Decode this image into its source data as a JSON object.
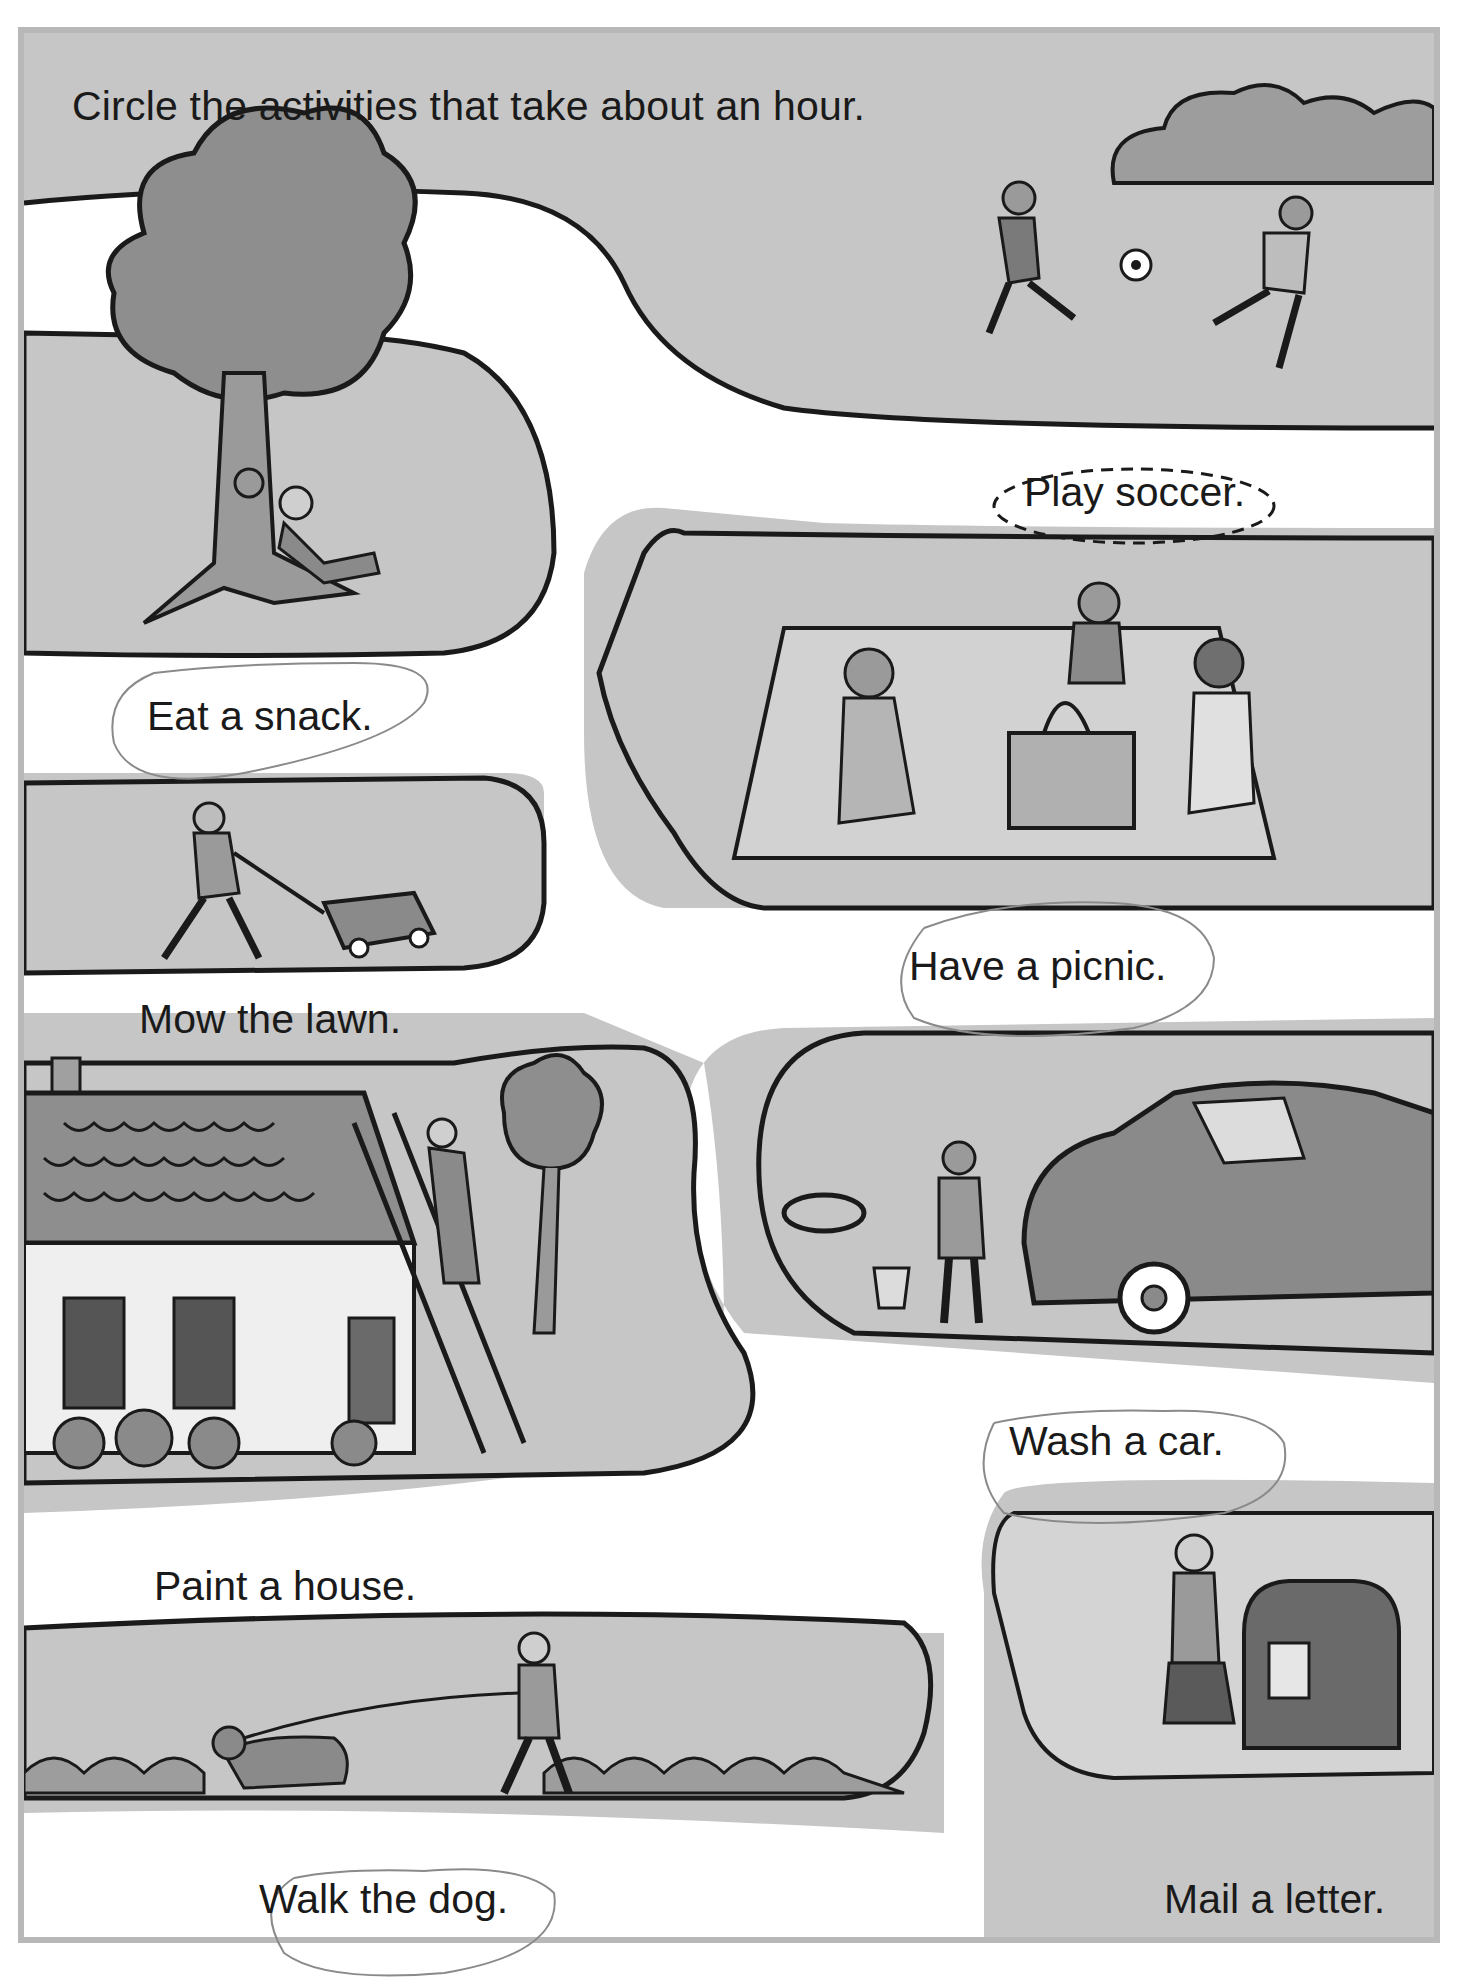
{
  "worksheet": {
    "instruction": "Circle the activities that take about an hour.",
    "example": {
      "label": "Play soccer.",
      "marking": "dashed-ellipse"
    },
    "activities": [
      {
        "id": "eat-snack",
        "label": "Eat a snack.",
        "circled_in_pencil": true
      },
      {
        "id": "play-soccer",
        "label": "Play soccer.",
        "circled_in_pencil": false,
        "example": true
      },
      {
        "id": "mow-lawn",
        "label": "Mow the lawn.",
        "circled_in_pencil": false
      },
      {
        "id": "have-picnic",
        "label": "Have a picnic.",
        "circled_in_pencil": true
      },
      {
        "id": "paint-house",
        "label": "Paint a house.",
        "circled_in_pencil": false
      },
      {
        "id": "wash-car",
        "label": "Wash a car.",
        "circled_in_pencil": true
      },
      {
        "id": "walk-dog",
        "label": "Walk the dog.",
        "circled_in_pencil": true
      },
      {
        "id": "mail-letter",
        "label": "Mail a letter.",
        "circled_in_pencil": false
      }
    ],
    "colors": {
      "grass": "#c4c4c4",
      "grass_dark": "#a9a9a9",
      "path": "#ffffff",
      "outline": "#1a1a1a",
      "frame": "#b8b8b8",
      "pencil": "#8a8a8a"
    }
  }
}
